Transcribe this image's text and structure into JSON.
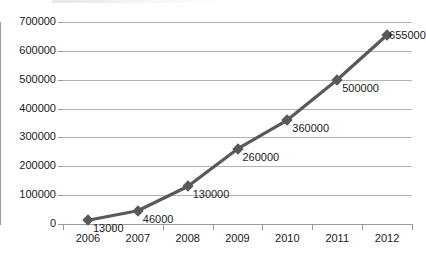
{
  "chart_data": {
    "type": "line",
    "title": "",
    "xlabel": "",
    "ylabel": "",
    "categories": [
      "2006",
      "2007",
      "2008",
      "2009",
      "2010",
      "2011",
      "2012"
    ],
    "values": [
      13000,
      46000,
      130000,
      260000,
      360000,
      500000,
      655000
    ],
    "point_labels": [
      "13000",
      "46000",
      "130000",
      "260000",
      "360000",
      "500000",
      "655000"
    ],
    "ylim": [
      0,
      700000
    ],
    "ytick_labels": [
      "0",
      "100000",
      "200000",
      "300000",
      "400000",
      "500000",
      "600000",
      "700000"
    ],
    "ytick_values": [
      0,
      100000,
      200000,
      300000,
      400000,
      500000,
      600000,
      700000
    ],
    "grid": true,
    "legend": "none",
    "series_color": "#595959",
    "grid_color": "#b3b3b3",
    "axis_color": "#9a9a9a",
    "marker": "diamond"
  }
}
